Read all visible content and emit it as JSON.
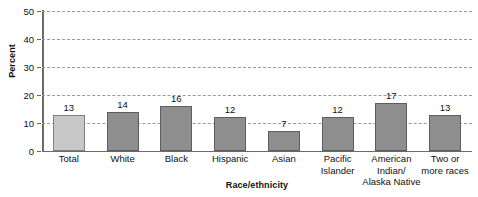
{
  "chart_data": {
    "type": "bar",
    "title": "",
    "subtitle": "",
    "xlabel": "Race/ethnicity",
    "ylabel": "Percent",
    "categories": [
      "Total",
      "White",
      "Black",
      "Hispanic",
      "Asian",
      "Pacific Islander",
      "American Indian/ Alaska Native",
      "Two or more races"
    ],
    "category_lines": [
      [
        "Total",
        ""
      ],
      [
        "White",
        ""
      ],
      [
        "Black",
        ""
      ],
      [
        "Hispanic",
        ""
      ],
      [
        "Asian",
        ""
      ],
      [
        "Pacific",
        "Islander"
      ],
      [
        "American Indian/",
        "Alaska Native"
      ],
      [
        "Two or",
        "more races"
      ]
    ],
    "values": [
      13,
      14,
      16,
      12,
      7,
      12,
      17,
      13
    ],
    "value_labels": [
      "13",
      "14",
      "16",
      "12",
      "7",
      "12",
      "17",
      "13"
    ],
    "ylim": [
      0,
      50
    ],
    "ytick_values": [
      0,
      10,
      20,
      30,
      40,
      50
    ],
    "ytick_labels": [
      "0",
      "10",
      "20",
      "30",
      "40",
      "50"
    ],
    "grid": true,
    "grid_style": "dashed",
    "grid_axis": "y",
    "legend": "none",
    "bar_colors": [
      "#c8c8c8",
      "#8e8e8e",
      "#8e8e8e",
      "#8e8e8e",
      "#8e8e8e",
      "#8e8e8e",
      "#8e8e8e",
      "#8e8e8e"
    ],
    "bar_edge_color": "#5d5d5d",
    "highlight_color": "#c8c8c8",
    "series_color": "#8e8e8e",
    "axis_color": "#6b6b6b",
    "gridline_color": "#9a9a9a",
    "text_color": "#111111"
  }
}
